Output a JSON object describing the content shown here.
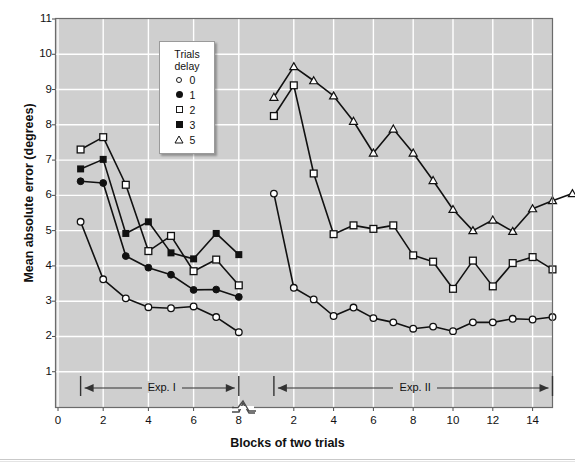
{
  "chart_data": {
    "type": "line",
    "title": "",
    "xlabel": "Blocks of two trials",
    "ylabel": "Mean absolute error (degrees)",
    "ylim": [
      0,
      11
    ],
    "yticks": [
      11,
      10,
      9,
      8,
      7,
      6,
      5,
      4,
      3,
      2,
      1
    ],
    "grid": true,
    "axis_break": true,
    "legend": {
      "position": "upper-center-left",
      "title_line1": "Trials",
      "title_line2": "delay",
      "entries": [
        {
          "label": "0",
          "marker": "open-circle"
        },
        {
          "label": "1",
          "marker": "filled-circle"
        },
        {
          "label": "2",
          "marker": "open-square"
        },
        {
          "label": "3",
          "marker": "filled-square"
        },
        {
          "label": "5",
          "marker": "open-triangle"
        }
      ]
    },
    "panels": [
      {
        "name": "Exp. I",
        "xticks": [
          0,
          2,
          4,
          6,
          8
        ],
        "x": [
          1,
          2,
          3,
          4,
          5,
          6,
          7,
          8
        ],
        "series": [
          {
            "name": "0",
            "marker": "open-circle",
            "values": [
              5.25,
              3.62,
              3.08,
              2.83,
              2.8,
              2.85,
              2.55,
              2.12
            ]
          },
          {
            "name": "1",
            "marker": "filled-circle",
            "values": [
              6.4,
              6.35,
              4.28,
              3.95,
              3.75,
              3.32,
              3.33,
              3.12
            ]
          },
          {
            "name": "2",
            "marker": "open-square",
            "values": [
              7.3,
              7.65,
              6.3,
              4.42,
              4.85,
              3.85,
              4.18,
              3.45
            ]
          },
          {
            "name": "3",
            "marker": "filled-square",
            "values": [
              6.75,
              7.02,
              4.92,
              5.25,
              4.37,
              4.2,
              4.92,
              4.32
            ]
          }
        ]
      },
      {
        "name": "Exp. II",
        "xticks": [
          2,
          4,
          6,
          8,
          10,
          12,
          14
        ],
        "x": [
          1,
          2,
          3,
          4,
          5,
          6,
          7,
          8,
          9,
          10,
          11,
          12,
          13,
          14,
          15
        ],
        "series": [
          {
            "name": "0",
            "marker": "open-circle",
            "values": [
              6.05,
              3.38,
              3.05,
              2.58,
              2.82,
              2.52,
              2.4,
              2.22,
              2.28,
              2.15,
              2.4,
              2.4,
              2.5,
              2.48,
              2.55
            ]
          },
          {
            "name": "2",
            "marker": "open-square",
            "values": [
              8.25,
              9.12,
              6.62,
              4.9,
              5.15,
              5.05,
              5.15,
              4.3,
              4.12,
              3.35,
              4.15,
              3.42,
              4.08,
              4.25,
              3.9
            ]
          },
          {
            "name": "5",
            "marker": "open-triangle",
            "values": [
              8.78,
              9.65,
              9.25,
              8.82,
              8.1,
              7.2,
              7.88,
              7.2,
              6.42,
              5.6,
              5.0,
              5.3,
              4.98,
              5.62,
              5.85,
              6.05
            ]
          }
        ]
      }
    ]
  }
}
